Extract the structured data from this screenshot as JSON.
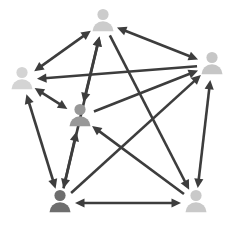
{
  "diagram": {
    "type": "directed-network",
    "background_color": "#ffffff",
    "canvas": {
      "width": 233,
      "height": 232
    },
    "icon_name": "person-icon",
    "edge_color": "#3d3d3d",
    "edge_width": 2.6,
    "arrowhead_size": 7,
    "nodes": [
      {
        "id": "top",
        "label": "Person Top",
        "x": 103,
        "y": 22,
        "color": "#cccccc",
        "scale": 1.0
      },
      {
        "id": "right",
        "label": "Person Right",
        "x": 212,
        "y": 65,
        "color": "#c6c6c6",
        "scale": 1.0
      },
      {
        "id": "left",
        "label": "Person Left",
        "x": 22,
        "y": 80,
        "color": "#d4d4d4",
        "scale": 1.0
      },
      {
        "id": "center",
        "label": "Person Center",
        "x": 80,
        "y": 117,
        "color": "#989898",
        "scale": 1.0
      },
      {
        "id": "bottom_left",
        "label": "Person Bottom Left",
        "x": 60,
        "y": 203,
        "color": "#6e6e6e",
        "scale": 1.0
      },
      {
        "id": "bottom_right",
        "label": "Person Bottom Right",
        "x": 196,
        "y": 203,
        "color": "#c9c9c9",
        "scale": 1.0
      }
    ],
    "edges": [
      {
        "id": "e1",
        "from": "left",
        "to": "top",
        "direction": "both"
      },
      {
        "id": "e2",
        "from": "center",
        "to": "top",
        "direction": "both"
      },
      {
        "id": "e3",
        "from": "left",
        "to": "center",
        "direction": "both"
      },
      {
        "id": "e4",
        "from": "right",
        "to": "left",
        "direction": "forward"
      },
      {
        "id": "e5",
        "from": "top",
        "to": "right",
        "direction": "both"
      },
      {
        "id": "e6",
        "from": "bottom_left",
        "to": "top",
        "direction": "forward"
      },
      {
        "id": "e7",
        "from": "center",
        "to": "right",
        "direction": "forward"
      },
      {
        "id": "e8",
        "from": "bottom_left",
        "to": "right",
        "direction": "forward"
      },
      {
        "id": "e9",
        "from": "right",
        "to": "bottom_right",
        "direction": "both"
      },
      {
        "id": "e10",
        "from": "left",
        "to": "bottom_left",
        "direction": "both"
      },
      {
        "id": "e11",
        "from": "center",
        "to": "bottom_left",
        "direction": "both"
      },
      {
        "id": "e12",
        "from": "bottom_left",
        "to": "bottom_right",
        "direction": "both"
      },
      {
        "id": "e13",
        "from": "bottom_right",
        "to": "center",
        "direction": "forward"
      },
      {
        "id": "e14",
        "from": "top",
        "to": "bottom_right",
        "direction": "forward"
      }
    ]
  }
}
